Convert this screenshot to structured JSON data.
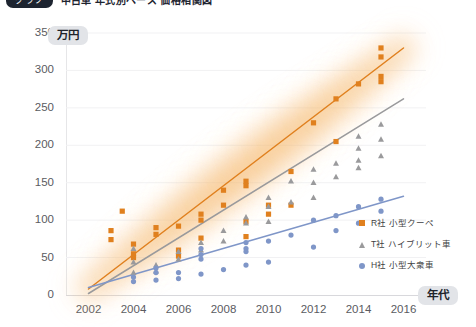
{
  "header": {
    "badge": "グラフ",
    "title": "中古車 年式別ベース 価格相関図"
  },
  "axes": {
    "y_unit_badge": "万円",
    "x_unit_badge": "年代",
    "y_ticks": [
      0,
      50,
      100,
      150,
      200,
      250,
      300,
      350
    ],
    "x_ticks": [
      2002,
      2004,
      2006,
      2008,
      2010,
      2012,
      2014,
      2016
    ]
  },
  "colors": {
    "orange": "#e0801e",
    "gray": "#9a9a9c",
    "blue": "#7f96c8",
    "grid": "#f1f1f3",
    "badge_bg": "#e2e4e8",
    "title_badge_bg": "#1d2430"
  },
  "legend": [
    {
      "marker": "square-marker",
      "label": "R社 小型クーペ",
      "color": "#e0801e"
    },
    {
      "marker": "triangle-marker",
      "label": "T社 ハイブリット車",
      "color": "#9a9a9c"
    },
    {
      "marker": "circle-marker",
      "label": "H社 小型大衆車",
      "color": "#7f96c8"
    }
  ],
  "chart_data": {
    "type": "scatter",
    "title": "中古車 年式別ベース 価格相関図",
    "xlabel": "年代",
    "ylabel": "万円",
    "xlim": [
      2001,
      2017
    ],
    "ylim": [
      0,
      350
    ],
    "grid": true,
    "legend_position": "inside-bottom-right",
    "highlight_band": {
      "series": "R社 小型クーペ",
      "style": "diffuse orange glow along trend line"
    },
    "series": [
      {
        "name": "R社 小型クーペ",
        "marker": "square",
        "color": "#e0801e",
        "points": [
          [
            2003,
            86
          ],
          [
            2003,
            74
          ],
          [
            2003.5,
            112
          ],
          [
            2004,
            68
          ],
          [
            2004,
            55
          ],
          [
            2004,
            50
          ],
          [
            2005,
            90
          ],
          [
            2005,
            81
          ],
          [
            2006,
            92
          ],
          [
            2006,
            60
          ],
          [
            2006,
            52
          ],
          [
            2007,
            108
          ],
          [
            2007,
            100
          ],
          [
            2007,
            76
          ],
          [
            2008,
            140
          ],
          [
            2008,
            120
          ],
          [
            2009,
            152
          ],
          [
            2009,
            146
          ],
          [
            2009,
            98
          ],
          [
            2009,
            78
          ],
          [
            2010,
            120
          ],
          [
            2010,
            108
          ],
          [
            2011,
            165
          ],
          [
            2011,
            120
          ],
          [
            2012,
            230
          ],
          [
            2013,
            262
          ],
          [
            2013,
            205
          ],
          [
            2014,
            282
          ],
          [
            2015,
            330
          ],
          [
            2015,
            318
          ],
          [
            2015,
            292
          ],
          [
            2015,
            285
          ]
        ],
        "trend_line": {
          "x": [
            2002,
            2016
          ],
          "y": [
            8,
            330
          ]
        }
      },
      {
        "name": "T社 ハイブリット車",
        "marker": "triangle",
        "color": "#9a9a9c",
        "points": [
          [
            2004,
            62
          ],
          [
            2004,
            44
          ],
          [
            2004,
            30
          ],
          [
            2005,
            40
          ],
          [
            2005,
            32
          ],
          [
            2006,
            58
          ],
          [
            2006,
            48
          ],
          [
            2007,
            70
          ],
          [
            2007,
            60
          ],
          [
            2008,
            86
          ],
          [
            2008,
            72
          ],
          [
            2009,
            104
          ],
          [
            2009,
            96
          ],
          [
            2010,
            130
          ],
          [
            2010,
            118
          ],
          [
            2010,
            98
          ],
          [
            2011,
            152
          ],
          [
            2011,
            124
          ],
          [
            2012,
            168
          ],
          [
            2012,
            150
          ],
          [
            2012,
            130
          ],
          [
            2013,
            176
          ],
          [
            2013,
            158
          ],
          [
            2014,
            212
          ],
          [
            2014,
            196
          ],
          [
            2014,
            180
          ],
          [
            2014,
            170
          ],
          [
            2015,
            228
          ],
          [
            2015,
            208
          ],
          [
            2015,
            186
          ]
        ],
        "trend_line": {
          "x": [
            2002,
            2016
          ],
          "y": [
            2,
            262
          ]
        }
      },
      {
        "name": "H社 小型大衆車",
        "marker": "circle",
        "color": "#7f96c8",
        "points": [
          [
            2004,
            24
          ],
          [
            2004,
            18
          ],
          [
            2005,
            36
          ],
          [
            2005,
            30
          ],
          [
            2005,
            20
          ],
          [
            2006,
            30
          ],
          [
            2006,
            22
          ],
          [
            2007,
            62
          ],
          [
            2007,
            54
          ],
          [
            2007,
            48
          ],
          [
            2007,
            28
          ],
          [
            2008,
            34
          ],
          [
            2009,
            70
          ],
          [
            2009,
            62
          ],
          [
            2009,
            58
          ],
          [
            2009,
            40
          ],
          [
            2010,
            72
          ],
          [
            2010,
            44
          ],
          [
            2011,
            80
          ],
          [
            2012,
            100
          ],
          [
            2012,
            64
          ],
          [
            2013,
            106
          ],
          [
            2013,
            86
          ],
          [
            2014,
            118
          ],
          [
            2014,
            96
          ],
          [
            2015,
            128
          ],
          [
            2015,
            112
          ]
        ],
        "trend_line": {
          "x": [
            2002,
            2016
          ],
          "y": [
            10,
            132
          ]
        }
      }
    ]
  }
}
